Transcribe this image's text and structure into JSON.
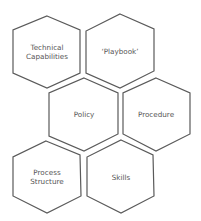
{
  "diagram": {
    "type": "hexagon-cluster",
    "colors": {
      "stroke": "#5a5a5a",
      "text": "#555555",
      "background": "#ffffff"
    },
    "hexagons": [
      {
        "id": "technical-capabilities",
        "lines": [
          "Technical",
          "Capabilities"
        ],
        "points": "47,16 80,30 80,73 47,88 13,73 13,30",
        "cx": 47,
        "cy": 52
      },
      {
        "id": "playbook",
        "lines": [
          "‘Playbook’"
        ],
        "points": "120,14 154,29 154,71 120,88 86,73 86,31",
        "cx": 120,
        "cy": 51
      },
      {
        "id": "policy",
        "lines": [
          "Policy"
        ],
        "points": "84,78 118,93 118,134 84,151 49,136 49,93",
        "cx": 84,
        "cy": 115
      },
      {
        "id": "procedure",
        "lines": [
          "Procedure"
        ],
        "points": "156,78 190,93 190,134 156,151 123,134 123,93",
        "cx": 156,
        "cy": 115
      },
      {
        "id": "process-structure",
        "lines": [
          "Process",
          "Structure"
        ],
        "points": "46,141 80,155 81,196 47,213 13,196 13,157",
        "cx": 47,
        "cy": 178
      },
      {
        "id": "skills",
        "lines": [
          "Skills"
        ],
        "points": "121,140 153,155 154,196 121,213 87,196 87,157",
        "cx": 121,
        "cy": 177
      }
    ]
  }
}
